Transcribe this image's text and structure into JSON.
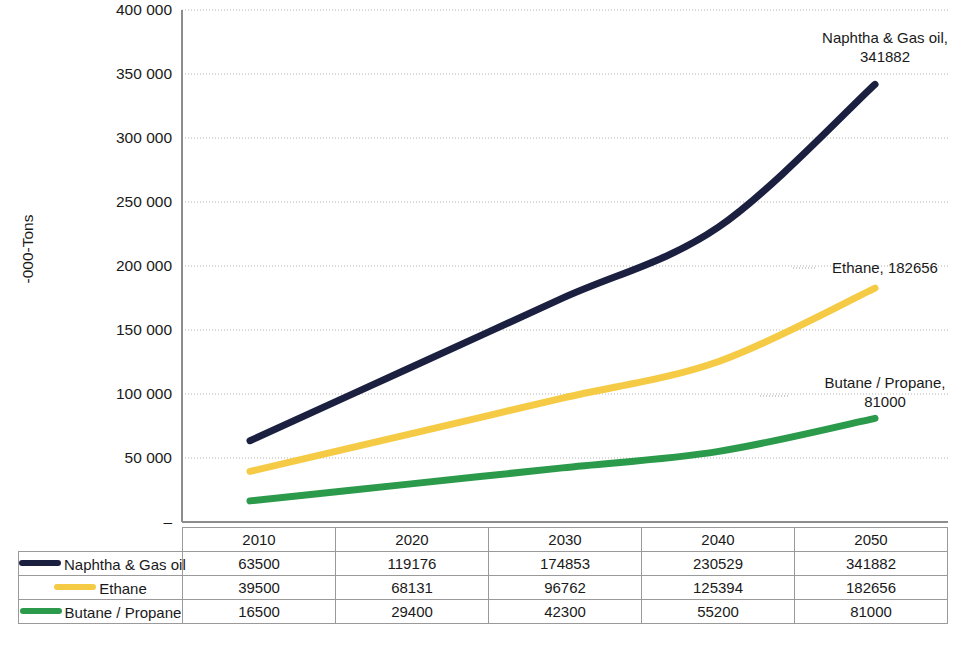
{
  "chart_data": {
    "type": "line",
    "title": "",
    "xlabel": "",
    "ylabel": "-000-Tons",
    "categories": [
      "2010",
      "2020",
      "2030",
      "2040",
      "2050"
    ],
    "ylim": [
      0,
      400000
    ],
    "ytick_values": [
      0,
      50000,
      100000,
      150000,
      200000,
      250000,
      300000,
      350000,
      400000
    ],
    "ytick_labels": [
      "–",
      "50 000",
      "100 000",
      "150 000",
      "200 000",
      "250 000",
      "300 000",
      "350 000",
      "400 000"
    ],
    "grid": true,
    "legend_position": "table-row-headers",
    "series": [
      {
        "name": "Naphtha & Gas oil",
        "color": "#1b2040",
        "values": [
          63500,
          119176,
          174853,
          230529,
          341882
        ]
      },
      {
        "name": "Ethane",
        "color": "#f5cb46",
        "values": [
          39500,
          68131,
          96762,
          125394,
          182656
        ]
      },
      {
        "name": "Butane / Propane",
        "color": "#2b9a4b",
        "values": [
          16500,
          29400,
          42300,
          55200,
          81000
        ]
      }
    ],
    "annotations": [
      {
        "id": "naphtha",
        "line1": "Naphtha & Gas oil,",
        "line2": "341882"
      },
      {
        "id": "ethane",
        "line1": "Ethane, 182656",
        "line2": ""
      },
      {
        "id": "butane",
        "line1": "Butane / Propane,",
        "line2": "81000"
      }
    ]
  },
  "table": {
    "corner_label": "",
    "column_headers": [
      "2010",
      "2020",
      "2030",
      "2040",
      "2050"
    ],
    "rows": [
      {
        "label": "Naphtha & Gas oil",
        "color": "#1b2040",
        "values": [
          "63500",
          "119176",
          "174853",
          "230529",
          "341882"
        ]
      },
      {
        "label": "Ethane",
        "color": "#f5cb46",
        "values": [
          "39500",
          "68131",
          "96762",
          "125394",
          "182656"
        ]
      },
      {
        "label": "Butane / Propane",
        "color": "#2b9a4b",
        "values": [
          "16500",
          "29400",
          "42300",
          "55200",
          "81000"
        ]
      }
    ]
  },
  "axis": {
    "y_title": "-000-Tons"
  }
}
